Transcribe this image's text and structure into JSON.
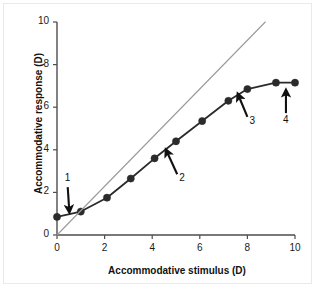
{
  "chart_data": {
    "type": "line",
    "title": "",
    "xlabel": "Accommodative stimulus (D)",
    "ylabel": "Accommodative response (D)",
    "xlim": [
      0,
      10
    ],
    "ylim": [
      0,
      10
    ],
    "xticks": [
      "0",
      "2",
      "4",
      "6",
      "8",
      "10"
    ],
    "yticks": [
      "0",
      "2",
      "4",
      "6",
      "8",
      "10"
    ],
    "xtick_values": [
      0,
      2,
      4,
      6,
      8,
      10
    ],
    "ytick_values": [
      0,
      2,
      4,
      6,
      8,
      10
    ],
    "grid": false,
    "legend": "none",
    "series": [
      {
        "name": "Accommodative response",
        "marker": "filled-circle",
        "color": "#2b2b2b",
        "x": [
          0,
          1,
          2.1,
          3.1,
          4.1,
          5,
          6.1,
          7.2,
          8,
          9.2,
          10
        ],
        "y": [
          0.85,
          1.1,
          1.75,
          2.65,
          3.6,
          4.4,
          5.35,
          6.3,
          6.85,
          7.15,
          7.15
        ]
      },
      {
        "name": "1:1 reference line",
        "marker": "none",
        "color": "#9a9a9a",
        "x": [
          0,
          8.75
        ],
        "y": [
          0,
          10
        ]
      }
    ],
    "annotations": [
      {
        "label": "1",
        "label_x": 0.45,
        "label_y": 2.25,
        "tip_x": 0.52,
        "tip_y": 1.08,
        "direction": "down"
      },
      {
        "label": "2",
        "label_x": 5.05,
        "label_y": 2.85,
        "tip_x": 4.58,
        "tip_y": 4.0,
        "direction": "up-left"
      },
      {
        "label": "3",
        "label_x": 8.0,
        "label_y": 5.55,
        "tip_x": 7.6,
        "tip_y": 6.62,
        "direction": "up-left"
      },
      {
        "label": "4",
        "label_x": 9.62,
        "label_y": 5.72,
        "tip_x": 9.62,
        "tip_y": 6.8,
        "direction": "up"
      }
    ]
  }
}
